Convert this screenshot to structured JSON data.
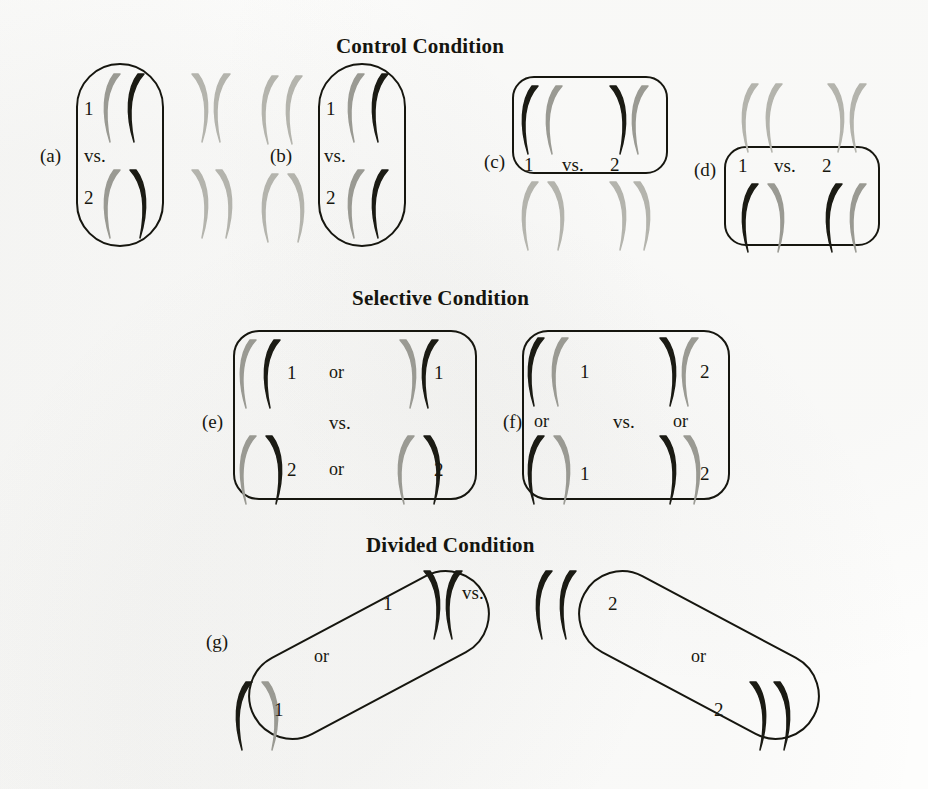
{
  "figure": {
    "caption_headings": [
      {
        "id": "control",
        "text": "Control Condition",
        "x": 336,
        "y": 34
      },
      {
        "id": "selective",
        "text": "Selective Condition",
        "x": 352,
        "y": 286
      },
      {
        "id": "divided",
        "text": "Divided Condition",
        "x": 366,
        "y": 533
      }
    ],
    "words": {
      "vs": "vs.",
      "or": "or",
      "one": "1",
      "two": "2"
    },
    "panel_tags": [
      "(a)",
      "(b)",
      "(c)",
      "(d)",
      "(e)",
      "(f)",
      "(g)"
    ],
    "colors": {
      "ink": "#16160f",
      "gray_glyph": "#9a9a93",
      "black_glyph": "#1b1b14",
      "light_glyph": "#b4b4ad",
      "paper": "#fdfdfc"
    },
    "panels": [
      {
        "id": "a",
        "tag": "(a)",
        "tag_pos": {
          "x": 40,
          "y": 146
        },
        "box": {
          "x": 76,
          "y": 63,
          "w": 84,
          "h": 180,
          "shape": "pill"
        },
        "labels": [
          {
            "text": "1",
            "x": 84,
            "y": 99,
            "kind": "num"
          },
          {
            "text": "vs.",
            "x": 84,
            "y": 146,
            "kind": "vs"
          },
          {
            "text": "2",
            "x": 84,
            "y": 188,
            "kind": "num"
          }
        ],
        "glyph_groups": [
          {
            "x": 100,
            "y": 72,
            "items": [
              {
                "t": "left",
                "c": "gray"
              },
              {
                "t": "left",
                "c": "black"
              }
            ]
          },
          {
            "x": 100,
            "y": 168,
            "items": [
              {
                "t": "left",
                "c": "gray"
              },
              {
                "t": "right",
                "c": "black"
              }
            ]
          },
          {
            "x": 186,
            "y": 72,
            "items": [
              {
                "t": "right",
                "c": "light"
              },
              {
                "t": "left",
                "c": "light"
              }
            ]
          },
          {
            "x": 186,
            "y": 168,
            "items": [
              {
                "t": "right",
                "c": "light"
              },
              {
                "t": "right",
                "c": "light"
              }
            ]
          }
        ]
      },
      {
        "id": "b",
        "tag": "(b)",
        "tag_pos": {
          "x": 270,
          "y": 146
        },
        "box": {
          "x": 318,
          "y": 63,
          "w": 84,
          "h": 180,
          "shape": "pill"
        },
        "labels": [
          {
            "text": "1",
            "x": 326,
            "y": 99,
            "kind": "num"
          },
          {
            "text": "vs.",
            "x": 324,
            "y": 146,
            "kind": "vs"
          },
          {
            "text": "2",
            "x": 326,
            "y": 188,
            "kind": "num"
          }
        ],
        "glyph_groups": [
          {
            "x": 258,
            "y": 74,
            "items": [
              {
                "t": "left",
                "c": "light"
              },
              {
                "t": "left",
                "c": "light"
              }
            ]
          },
          {
            "x": 258,
            "y": 172,
            "items": [
              {
                "t": "left",
                "c": "light"
              },
              {
                "t": "right",
                "c": "light"
              }
            ]
          },
          {
            "x": 344,
            "y": 72,
            "items": [
              {
                "t": "left",
                "c": "gray"
              },
              {
                "t": "left",
                "c": "black"
              }
            ]
          },
          {
            "x": 344,
            "y": 168,
            "items": [
              {
                "t": "left",
                "c": "gray"
              },
              {
                "t": "left",
                "c": "black"
              }
            ]
          }
        ]
      },
      {
        "id": "c",
        "tag": "(c)",
        "tag_pos": {
          "x": 484,
          "y": 152
        },
        "box": {
          "x": 512,
          "y": 76,
          "w": 152,
          "h": 94,
          "shape": "soft"
        },
        "labels": [
          {
            "text": "1",
            "x": 524,
            "y": 155,
            "kind": "num"
          },
          {
            "text": "vs.",
            "x": 562,
            "y": 155,
            "kind": "vs"
          },
          {
            "text": "2",
            "x": 610,
            "y": 155,
            "kind": "num"
          }
        ],
        "glyph_groups": [
          {
            "x": 518,
            "y": 84,
            "items": [
              {
                "t": "left",
                "c": "black"
              },
              {
                "t": "left",
                "c": "gray"
              }
            ]
          },
          {
            "x": 604,
            "y": 84,
            "items": [
              {
                "t": "right",
                "c": "black"
              },
              {
                "t": "left",
                "c": "gray"
              }
            ]
          },
          {
            "x": 518,
            "y": 180,
            "items": [
              {
                "t": "left",
                "c": "light"
              },
              {
                "t": "right",
                "c": "light"
              }
            ]
          },
          {
            "x": 604,
            "y": 180,
            "items": [
              {
                "t": "right",
                "c": "light"
              },
              {
                "t": "right",
                "c": "light"
              }
            ]
          }
        ]
      },
      {
        "id": "d",
        "tag": "(d)",
        "tag_pos": {
          "x": 694,
          "y": 160
        },
        "box": {
          "x": 724,
          "y": 146,
          "w": 152,
          "h": 96,
          "shape": "soft"
        },
        "labels": [
          {
            "text": "1",
            "x": 738,
            "y": 156,
            "kind": "num"
          },
          {
            "text": "vs.",
            "x": 774,
            "y": 156,
            "kind": "vs"
          },
          {
            "text": "2",
            "x": 822,
            "y": 156,
            "kind": "num"
          }
        ],
        "glyph_groups": [
          {
            "x": 738,
            "y": 82,
            "items": [
              {
                "t": "left",
                "c": "light"
              },
              {
                "t": "left",
                "c": "light"
              }
            ]
          },
          {
            "x": 822,
            "y": 82,
            "items": [
              {
                "t": "right",
                "c": "light"
              },
              {
                "t": "left",
                "c": "light"
              }
            ]
          },
          {
            "x": 738,
            "y": 182,
            "items": [
              {
                "t": "left",
                "c": "black"
              },
              {
                "t": "right",
                "c": "gray"
              }
            ]
          },
          {
            "x": 822,
            "y": 182,
            "items": [
              {
                "t": "left",
                "c": "black"
              },
              {
                "t": "left",
                "c": "gray"
              }
            ]
          }
        ]
      },
      {
        "id": "e",
        "tag": "(e)",
        "tag_pos": {
          "x": 202,
          "y": 412
        },
        "box": {
          "x": 233,
          "y": 330,
          "w": 240,
          "h": 166,
          "shape": "softer"
        },
        "labels": [
          {
            "text": "1",
            "x": 287,
            "y": 363,
            "kind": "num"
          },
          {
            "text": "or",
            "x": 329,
            "y": 363,
            "kind": "or"
          },
          {
            "text": "1",
            "x": 434,
            "y": 363,
            "kind": "num"
          },
          {
            "text": "vs.",
            "x": 329,
            "y": 413,
            "kind": "vs"
          },
          {
            "text": "2",
            "x": 287,
            "y": 460,
            "kind": "num"
          },
          {
            "text": "or",
            "x": 329,
            "y": 460,
            "kind": "or"
          },
          {
            "text": "2",
            "x": 434,
            "y": 460,
            "kind": "num"
          }
        ],
        "glyph_groups": [
          {
            "x": 236,
            "y": 338,
            "items": [
              {
                "t": "left",
                "c": "gray"
              },
              {
                "t": "left",
                "c": "black"
              }
            ]
          },
          {
            "x": 236,
            "y": 434,
            "items": [
              {
                "t": "left",
                "c": "gray"
              },
              {
                "t": "right",
                "c": "black"
              }
            ]
          },
          {
            "x": 394,
            "y": 338,
            "items": [
              {
                "t": "right",
                "c": "gray"
              },
              {
                "t": "left",
                "c": "black"
              }
            ]
          },
          {
            "x": 394,
            "y": 434,
            "items": [
              {
                "t": "left",
                "c": "gray"
              },
              {
                "t": "right",
                "c": "black"
              }
            ]
          }
        ]
      },
      {
        "id": "f",
        "tag": "(f)",
        "tag_pos": {
          "x": 503,
          "y": 412
        },
        "box": {
          "x": 522,
          "y": 330,
          "w": 204,
          "h": 166,
          "shape": "softer"
        },
        "labels": [
          {
            "text": "1",
            "x": 580,
            "y": 362,
            "kind": "num"
          },
          {
            "text": "2",
            "x": 700,
            "y": 362,
            "kind": "num"
          },
          {
            "text": "or",
            "x": 534,
            "y": 412,
            "kind": "or"
          },
          {
            "text": "vs.",
            "x": 613,
            "y": 412,
            "kind": "vs"
          },
          {
            "text": "or",
            "x": 673,
            "y": 412,
            "kind": "or"
          },
          {
            "text": "1",
            "x": 580,
            "y": 464,
            "kind": "num"
          },
          {
            "text": "2",
            "x": 700,
            "y": 464,
            "kind": "num"
          }
        ],
        "glyph_groups": [
          {
            "x": 524,
            "y": 336,
            "items": [
              {
                "t": "left",
                "c": "black"
              },
              {
                "t": "left",
                "c": "gray"
              }
            ]
          },
          {
            "x": 524,
            "y": 434,
            "items": [
              {
                "t": "left",
                "c": "black"
              },
              {
                "t": "right",
                "c": "gray"
              }
            ]
          },
          {
            "x": 654,
            "y": 336,
            "items": [
              {
                "t": "right",
                "c": "black"
              },
              {
                "t": "left",
                "c": "gray"
              }
            ]
          },
          {
            "x": 654,
            "y": 434,
            "items": [
              {
                "t": "right",
                "c": "black"
              },
              {
                "t": "right",
                "c": "gray"
              }
            ]
          }
        ]
      },
      {
        "id": "g",
        "tag": "(g)",
        "tag_pos": {
          "x": 206,
          "y": 632
        },
        "tilted_boxes": [
          {
            "x": 238,
            "y": 611,
            "w": 258,
            "h": 84,
            "rot": -28
          },
          {
            "x": 568,
            "y": 611,
            "w": 258,
            "h": 84,
            "rot": 28
          }
        ],
        "labels": [
          {
            "text": "vs.",
            "x": 462,
            "y": 583,
            "kind": "vs"
          },
          {
            "text": "1",
            "x": 383,
            "y": 594,
            "kind": "num"
          },
          {
            "text": "or",
            "x": 314,
            "y": 647,
            "kind": "or"
          },
          {
            "text": "1",
            "x": 274,
            "y": 700,
            "kind": "num"
          },
          {
            "text": "2",
            "x": 608,
            "y": 594,
            "kind": "num"
          },
          {
            "text": "or",
            "x": 691,
            "y": 647,
            "kind": "or"
          },
          {
            "text": "2",
            "x": 714,
            "y": 700,
            "kind": "num"
          }
        ],
        "glyph_groups": [
          {
            "x": 418,
            "y": 569,
            "items": [
              {
                "t": "right",
                "c": "black"
              },
              {
                "t": "left",
                "c": "black"
              }
            ]
          },
          {
            "x": 232,
            "y": 680,
            "items": [
              {
                "t": "left",
                "c": "black"
              },
              {
                "t": "right",
                "c": "gray"
              }
            ]
          },
          {
            "x": 532,
            "y": 569,
            "items": [
              {
                "t": "left",
                "c": "black"
              },
              {
                "t": "left",
                "c": "black"
              }
            ]
          },
          {
            "x": 744,
            "y": 680,
            "items": [
              {
                "t": "right",
                "c": "black"
              },
              {
                "t": "right",
                "c": "black"
              }
            ]
          }
        ]
      }
    ]
  }
}
